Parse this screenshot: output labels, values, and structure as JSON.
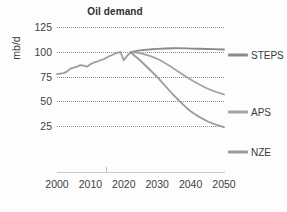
{
  "chart_data": {
    "type": "line",
    "title": "Oil demand",
    "xlabel": "",
    "ylabel": "mb/d",
    "xlim": [
      2000,
      2050
    ],
    "ylim": [
      0,
      125
    ],
    "grid": true,
    "legend_position": "right",
    "xticks": [
      "2000",
      "2010",
      "2020",
      "2030",
      "2040",
      "2050"
    ],
    "xtick_values": [
      2000,
      2010,
      2020,
      2030,
      2040,
      2050
    ],
    "yticks": [
      "125",
      "100",
      "75",
      "50",
      "25"
    ],
    "ytick_values": [
      125,
      100,
      75,
      50,
      25
    ],
    "series": [
      {
        "name": "Historical",
        "color": "#9c9c9c",
        "x": [
          2000,
          2001,
          2002,
          2003,
          2004,
          2005,
          2006,
          2007,
          2008,
          2009,
          2010,
          2011,
          2012,
          2013,
          2014,
          2015,
          2016,
          2017,
          2018,
          2019,
          2020,
          2021,
          2022
        ],
        "values": [
          77.5,
          78.0,
          78.5,
          80.0,
          83.0,
          84.0,
          85.0,
          86.5,
          86.0,
          85.0,
          87.5,
          89.0,
          90.0,
          91.5,
          92.5,
          94.5,
          96.0,
          97.5,
          99.0,
          99.8,
          91.5,
          96.0,
          99.5
        ]
      },
      {
        "name": "STEPS",
        "color": "#8a8a8a",
        "x": [
          2022,
          2025,
          2030,
          2035,
          2040,
          2045,
          2050
        ],
        "values": [
          99.5,
          101.5,
          103.0,
          103.6,
          103.3,
          102.8,
          102.3
        ]
      },
      {
        "name": "APS",
        "color": "#a4a4a4",
        "x": [
          2022,
          2025,
          2030,
          2035,
          2040,
          2045,
          2050
        ],
        "values": [
          99.5,
          98.5,
          93.0,
          83.0,
          72.0,
          63.0,
          57.0
        ]
      },
      {
        "name": "NZE",
        "color": "#9a9a9a",
        "x": [
          2022,
          2025,
          2030,
          2035,
          2040,
          2045,
          2050
        ],
        "values": [
          99.5,
          91.0,
          74.5,
          56.0,
          40.0,
          30.0,
          24.0
        ]
      }
    ]
  },
  "legend": {
    "entries": [
      {
        "label": "STEPS",
        "color": "#8a8a8a",
        "y": 55
      },
      {
        "label": "APS",
        "color": "#a4a4a4",
        "y": 112
      },
      {
        "label": "NZE",
        "color": "#9a9a9a",
        "y": 152
      }
    ]
  }
}
